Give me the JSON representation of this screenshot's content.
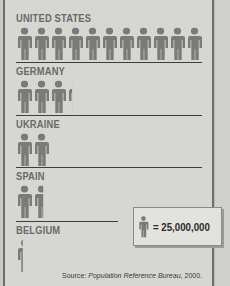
{
  "chart_data": {
    "type": "pictograph",
    "title": "",
    "unit_label": "= 25,000,000",
    "unit_value": 25000000,
    "icon": "person-icon",
    "categories": [
      "UNITED STATES",
      "GERMANY",
      "UKRAINE",
      "SPAIN",
      "BELGIUM"
    ],
    "icon_counts": [
      11,
      3.3,
      2,
      1.6,
      0.4
    ],
    "values": [
      275000000,
      82000000,
      50000000,
      40000000,
      10000000
    ],
    "source": "Source: Population Reference Bureau, 2000."
  },
  "rows": [
    {
      "country": "UNITED STATES",
      "icons": 11
    },
    {
      "country": "GERMANY",
      "icons": 3.3
    },
    {
      "country": "UKRAINE",
      "icons": 2
    },
    {
      "country": "SPAIN",
      "icons": 1.6
    },
    {
      "country": "BELGIUM",
      "icons": 0.4
    }
  ],
  "legend": {
    "text": "= 25,000,000"
  },
  "source": {
    "prefix": "Source: ",
    "publisher": "Population Reference Bureau",
    "year": ", 2000."
  },
  "colors": {
    "figure": "#7a7a78",
    "background": "#d6d6d3",
    "divider": "#3e3e3c"
  }
}
